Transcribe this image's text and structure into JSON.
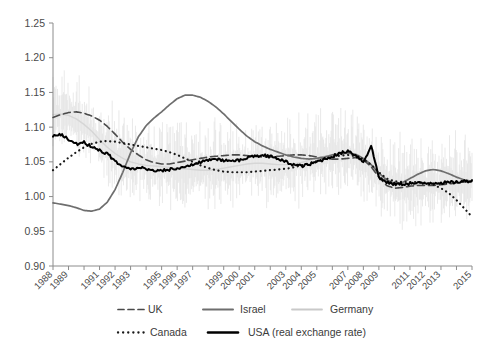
{
  "chart_data": {
    "type": "line",
    "title": "",
    "xlabel": "",
    "ylabel": "",
    "xlim": [
      1988,
      2015
    ],
    "ylim": [
      0.9,
      1.25
    ],
    "grid": false,
    "legend_position": "bottom",
    "y_ticks": [
      "1.25",
      "1.20",
      "1.15",
      "1.10",
      "1.05",
      "1.00",
      "0.95",
      "0.90"
    ],
    "y_tick_values": [
      1.25,
      1.2,
      1.15,
      1.1,
      1.05,
      1.0,
      0.95,
      0.9
    ],
    "x_tick_labels": [
      "1988",
      "1989",
      "1991",
      "1992",
      "1993",
      "1995",
      "1996",
      "1997",
      "1999",
      "2000",
      "2001",
      "2003",
      "2004",
      "2005",
      "2007",
      "2008",
      "2009",
      "2011",
      "2012",
      "2013",
      "2015"
    ],
    "x_tick_values": [
      1988,
      1989,
      1991,
      1992,
      1993,
      1995,
      1996,
      1997,
      1999,
      2000,
      2001,
      2003,
      2004,
      2005,
      2007,
      2008,
      2009,
      2011,
      2012,
      2013,
      2015
    ],
    "x_minor_ticks": [
      1988,
      1989,
      1990,
      1991,
      1992,
      1993,
      1994,
      1995,
      1996,
      1997,
      1998,
      1999,
      2000,
      2001,
      2002,
      2003,
      2004,
      2005,
      2006,
      2007,
      2008,
      2009,
      2010,
      2011,
      2012,
      2013,
      2014,
      2015
    ],
    "x": [
      1988.0,
      1988.5,
      1989.0,
      1989.5,
      1990.0,
      1990.5,
      1991.0,
      1991.5,
      1992.0,
      1992.5,
      1993.0,
      1993.5,
      1994.0,
      1994.5,
      1995.0,
      1995.5,
      1996.0,
      1996.5,
      1997.0,
      1997.5,
      1998.0,
      1998.5,
      1999.0,
      1999.5,
      2000.0,
      2000.5,
      2001.0,
      2001.5,
      2002.0,
      2002.5,
      2003.0,
      2003.5,
      2004.0,
      2004.5,
      2005.0,
      2005.5,
      2006.0,
      2006.5,
      2007.0,
      2007.5,
      2008.0,
      2008.5,
      2009.0,
      2009.5,
      2010.0,
      2010.5,
      2011.0,
      2011.5,
      2012.0,
      2012.5,
      2013.0,
      2013.5,
      2014.0,
      2014.5,
      2015.0
    ],
    "series": [
      {
        "name": "UK",
        "style": "dashed",
        "color": "#4a4a4a",
        "width": 1.6,
        "values": [
          1.114,
          1.118,
          1.121,
          1.122,
          1.12,
          1.116,
          1.11,
          1.101,
          1.09,
          1.078,
          1.068,
          1.06,
          1.053,
          1.049,
          1.047,
          1.047,
          1.049,
          1.051,
          1.053,
          1.055,
          1.057,
          1.058,
          1.059,
          1.06,
          1.06,
          1.059,
          1.058,
          1.057,
          1.057,
          1.058,
          1.059,
          1.06,
          1.06,
          1.059,
          1.057,
          1.055,
          1.054,
          1.054,
          1.055,
          1.056,
          1.053,
          1.043,
          1.028,
          1.016,
          1.012,
          1.013,
          1.015,
          1.016,
          1.016,
          1.016,
          1.017,
          1.018,
          1.02,
          1.021,
          1.022
        ]
      },
      {
        "name": "Israel",
        "style": "solid",
        "color": "#6e6e6e",
        "width": 1.7,
        "values": [
          0.991,
          0.989,
          0.987,
          0.984,
          0.98,
          0.979,
          0.982,
          0.992,
          1.01,
          1.035,
          1.063,
          1.086,
          1.102,
          1.113,
          1.122,
          1.132,
          1.141,
          1.146,
          1.146,
          1.143,
          1.137,
          1.129,
          1.119,
          1.108,
          1.097,
          1.087,
          1.079,
          1.073,
          1.068,
          1.064,
          1.06,
          1.057,
          1.055,
          1.054,
          1.055,
          1.057,
          1.06,
          1.062,
          1.063,
          1.061,
          1.055,
          1.046,
          1.034,
          1.024,
          1.019,
          1.02,
          1.026,
          1.032,
          1.037,
          1.039,
          1.037,
          1.033,
          1.028,
          1.024,
          1.022
        ]
      },
      {
        "name": "Germany",
        "style": "solid-light",
        "color": "#d6d6d6",
        "width": 1.4,
        "values": [
          1.118,
          1.119,
          1.117,
          1.112,
          1.104,
          1.094,
          1.082,
          1.071,
          1.062,
          1.055,
          1.05,
          1.047,
          1.045,
          1.044,
          1.043,
          1.042,
          1.041,
          1.04,
          1.039,
          1.038,
          1.038,
          1.039,
          1.041,
          1.043,
          1.045,
          1.047,
          1.048,
          1.048,
          1.047,
          1.046,
          1.046,
          1.047,
          1.049,
          1.052,
          1.055,
          1.058,
          1.06,
          1.061,
          1.061,
          1.058,
          1.052,
          1.043,
          1.031,
          1.021,
          1.016,
          1.015,
          1.016,
          1.017,
          1.017,
          1.017,
          1.018,
          1.019,
          1.02,
          1.021,
          1.022
        ]
      },
      {
        "name": "Canada",
        "style": "dotted",
        "color": "#1a1a1a",
        "width": 2.2,
        "values": [
          1.038,
          1.047,
          1.056,
          1.064,
          1.071,
          1.076,
          1.079,
          1.08,
          1.079,
          1.077,
          1.075,
          1.073,
          1.071,
          1.069,
          1.067,
          1.064,
          1.06,
          1.055,
          1.05,
          1.045,
          1.041,
          1.038,
          1.036,
          1.035,
          1.035,
          1.035,
          1.036,
          1.037,
          1.038,
          1.039,
          1.04,
          1.042,
          1.045,
          1.048,
          1.051,
          1.054,
          1.057,
          1.059,
          1.06,
          1.058,
          1.054,
          1.046,
          1.035,
          1.026,
          1.022,
          1.021,
          1.021,
          1.021,
          1.02,
          1.017,
          1.012,
          1.005,
          0.995,
          0.983,
          0.971
        ]
      },
      {
        "name": "USA (real exchange rate)",
        "style": "solid-thick",
        "color": "#000000",
        "width": 2.0,
        "values": [
          1.086,
          1.09,
          1.082,
          1.076,
          1.078,
          1.072,
          1.067,
          1.061,
          1.052,
          1.043,
          1.04,
          1.042,
          1.04,
          1.038,
          1.037,
          1.039,
          1.041,
          1.043,
          1.046,
          1.05,
          1.053,
          1.054,
          1.052,
          1.05,
          1.052,
          1.056,
          1.058,
          1.06,
          1.058,
          1.054,
          1.05,
          1.046,
          1.044,
          1.046,
          1.05,
          1.054,
          1.058,
          1.062,
          1.066,
          1.06,
          1.05,
          1.073,
          1.028,
          1.02,
          1.018,
          1.018,
          1.019,
          1.019,
          1.019,
          1.02,
          1.02,
          1.02,
          1.021,
          1.022,
          1.023
        ]
      }
    ],
    "legend": [
      {
        "label": "UK",
        "style": "dashed",
        "color": "#4a4a4a"
      },
      {
        "label": "Israel",
        "style": "solid",
        "color": "#6e6e6e"
      },
      {
        "label": "Germany",
        "style": "solid-light",
        "color": "#c9c9c9"
      },
      {
        "label": "Canada",
        "style": "dotted",
        "color": "#1a1a1a"
      },
      {
        "label": "USA (real exchange rate)",
        "style": "solid-thick",
        "color": "#000000"
      }
    ]
  }
}
